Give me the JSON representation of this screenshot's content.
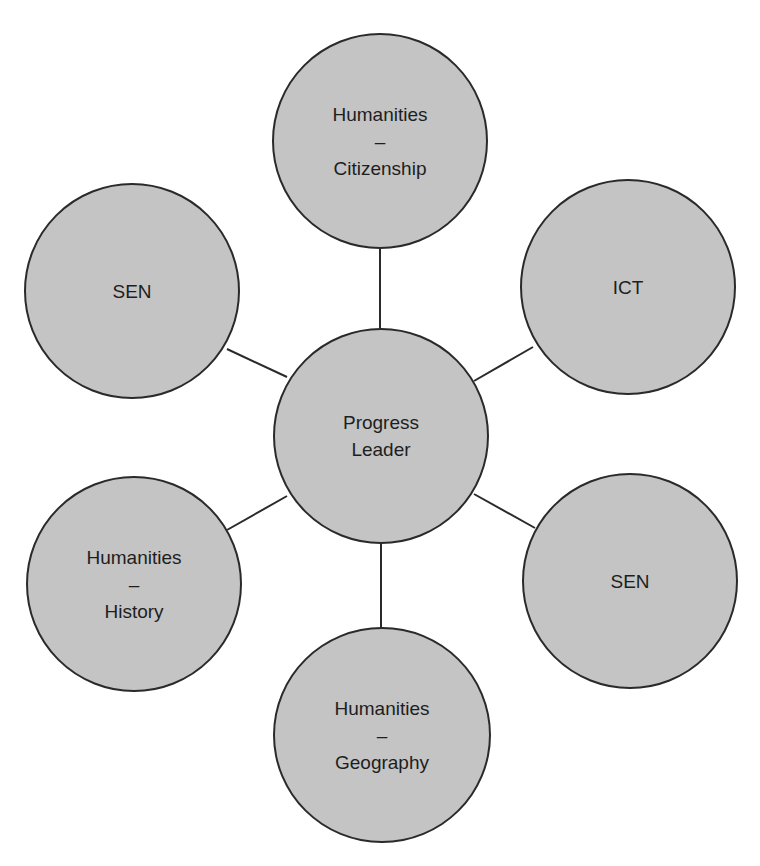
{
  "diagram": {
    "type": "hub-and-spoke",
    "colors": {
      "node_fill": "#c4c4c4",
      "node_stroke": "#2a2a2a",
      "connector": "#2a2a2a",
      "text": "#1e1e1e",
      "background": "#ffffff"
    },
    "center": {
      "id": "progress-leader",
      "lines": [
        "Progress",
        "Leader"
      ]
    },
    "nodes": [
      {
        "id": "humanities-citizenship",
        "lines": [
          "Humanities",
          "–",
          "Citizenship"
        ],
        "position": "top"
      },
      {
        "id": "ict",
        "lines": [
          "ICT"
        ],
        "position": "upper-right"
      },
      {
        "id": "sen-right",
        "lines": [
          "SEN"
        ],
        "position": "lower-right"
      },
      {
        "id": "humanities-geography",
        "lines": [
          "Humanities",
          "–",
          "Geography"
        ],
        "position": "bottom"
      },
      {
        "id": "humanities-history",
        "lines": [
          "Humanities",
          "–",
          "History"
        ],
        "position": "lower-left"
      },
      {
        "id": "sen-left",
        "lines": [
          "SEN"
        ],
        "position": "upper-left"
      }
    ],
    "edges": [
      [
        "progress-leader",
        "humanities-citizenship"
      ],
      [
        "progress-leader",
        "ict"
      ],
      [
        "progress-leader",
        "sen-right"
      ],
      [
        "progress-leader",
        "humanities-geography"
      ],
      [
        "progress-leader",
        "humanities-history"
      ],
      [
        "progress-leader",
        "sen-left"
      ]
    ]
  }
}
